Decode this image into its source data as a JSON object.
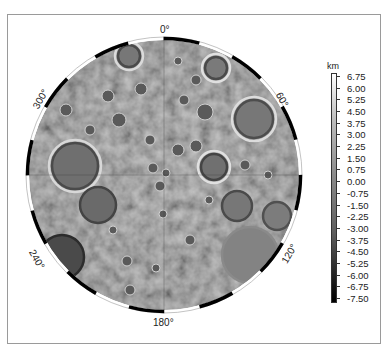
{
  "map": {
    "projection": "polar-stereographic",
    "longitude_labels": [
      {
        "label": "0°",
        "angle": 0
      },
      {
        "label": "60°",
        "angle": 60
      },
      {
        "label": "120°",
        "angle": 120
      },
      {
        "label": "180°",
        "angle": 180
      },
      {
        "label": "240°",
        "angle": 240
      },
      {
        "label": "300°",
        "angle": 300
      }
    ]
  },
  "colorbar": {
    "unit": "km",
    "labels": [
      "6.75",
      "6.00",
      "5.25",
      "4.50",
      "3.75",
      "3.00",
      "2.25",
      "1.50",
      "0.75",
      "0.00",
      "-0.75",
      "-1.50",
      "-2.25",
      "-3.00",
      "-3.75",
      "-4.50",
      "-5.25",
      "-6.00",
      "-6.75",
      "-7.50"
    ],
    "colors": {
      "top": "#ffffff",
      "bottom": "#000000"
    }
  },
  "chart_data": {
    "type": "heatmap",
    "title": "",
    "longitude_tick_labels": [
      "0°",
      "60°",
      "120°",
      "180°",
      "240°",
      "300°"
    ],
    "colorbar_label": "km",
    "colorbar_ticks": [
      6.75,
      6.0,
      5.25,
      4.5,
      3.75,
      3.0,
      2.25,
      1.5,
      0.75,
      0.0,
      -0.75,
      -1.5,
      -2.25,
      -3.0,
      -3.75,
      -4.5,
      -5.25,
      -6.0,
      -6.75,
      -7.5
    ],
    "value_range": [
      -7.5,
      6.75
    ],
    "colormap": "grayscale (white high, black low)",
    "legend_position": "right"
  }
}
